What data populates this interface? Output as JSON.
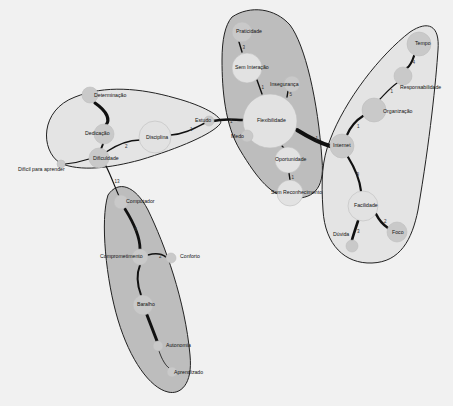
{
  "diagram": {
    "colors": {
      "background": "#f1f1f1",
      "cluster_light": "#e4e4e4",
      "cluster_dark": "#bdbdbd",
      "node": "#c9c9c9",
      "node_light": "#e2e2e2",
      "edge": "#111111"
    },
    "clusters": [
      {
        "id": "c1",
        "fill": "#e4e4e4",
        "path": "M60,163 C40,150 40,110 75,97 C105,85 140,88 175,98 C205,106 225,118 220,124 C212,134 180,148 140,160 C110,168 80,172 60,163 Z"
      },
      {
        "id": "c2",
        "fill": "#bdbdbd",
        "path": "M232,17 C250,5 275,8 290,25 C305,45 318,100 322,160 C325,190 312,200 290,198 C272,196 258,180 240,150 C225,125 222,90 222,60 C222,40 225,25 232,17 Z"
      },
      {
        "id": "c3",
        "fill": "#e4e4e4",
        "path": "M330,140 C345,100 380,55 410,32 C428,20 440,25 438,50 C436,80 430,140 418,210 C412,240 400,262 372,263 C345,264 325,245 323,210 C321,180 322,160 330,140 Z"
      },
      {
        "id": "c4",
        "fill": "#bdbdbd",
        "path": "M108,195 C118,180 135,185 148,210 C165,245 185,300 190,355 C193,385 180,395 168,392 C150,388 130,360 118,320 C106,280 100,220 108,195 Z"
      }
    ],
    "nodes": [
      {
        "id": "determinacao",
        "label": "Determinação",
        "x": 90,
        "y": 95,
        "r": 8,
        "lx": 94,
        "ly": 97
      },
      {
        "id": "dedicacao",
        "label": "Dedicação",
        "x": 104,
        "y": 134,
        "r": 10,
        "lx": 85,
        "ly": 135
      },
      {
        "id": "disciplina",
        "label": "Disciplina",
        "x": 155,
        "y": 137,
        "r": 16,
        "lx": 146,
        "ly": 139
      },
      {
        "id": "estudo",
        "label": "Estudo",
        "x": 209,
        "y": 121,
        "r": 5,
        "lx": 195,
        "ly": 122
      },
      {
        "id": "dificuldade",
        "label": "Dificuldade",
        "x": 99,
        "y": 158,
        "r": 10,
        "lx": 93,
        "ly": 160
      },
      {
        "id": "dificil",
        "label": "Difícil para aprender",
        "x": 61,
        "y": 164,
        "r": 4,
        "lx": 18,
        "ly": 171
      },
      {
        "id": "praticidade",
        "label": "Praticidade",
        "x": 242,
        "y": 32,
        "r": 10,
        "lx": 236,
        "ly": 33
      },
      {
        "id": "sem_interacao",
        "label": "Sem Interação",
        "x": 247,
        "y": 68,
        "r": 15,
        "lx": 235,
        "ly": 69
      },
      {
        "id": "inseguranca",
        "label": "Insegurança",
        "x": 292,
        "y": 84,
        "r": 8,
        "lx": 270,
        "ly": 86
      },
      {
        "id": "flexibilidade",
        "label": "Flexibilidade",
        "x": 270,
        "y": 121,
        "r": 27,
        "lx": 257,
        "ly": 122
      },
      {
        "id": "medo",
        "label": "Medo",
        "x": 247,
        "y": 136,
        "r": 6,
        "lx": 231,
        "ly": 138
      },
      {
        "id": "oportunidade",
        "label": "Oportunidade",
        "x": 288,
        "y": 160,
        "r": 13,
        "lx": 275,
        "ly": 161
      },
      {
        "id": "sem_reconhecimento",
        "label": "Sem Reconhecimento",
        "x": 290,
        "y": 193,
        "r": 13,
        "lx": 271,
        "ly": 194
      },
      {
        "id": "tempo",
        "label": "Tempo",
        "x": 419,
        "y": 44,
        "r": 12,
        "lx": 415,
        "ly": 45
      },
      {
        "id": "responsabilidade",
        "label": "Responsabilidade",
        "x": 403,
        "y": 76,
        "r": 9,
        "lx": 400,
        "ly": 89
      },
      {
        "id": "organizacao",
        "label": "Organização",
        "x": 374,
        "y": 110,
        "r": 12,
        "lx": 383,
        "ly": 113
      },
      {
        "id": "internet",
        "label": "Internet",
        "x": 342,
        "y": 146,
        "r": 12,
        "lx": 333,
        "ly": 147
      },
      {
        "id": "facilidade",
        "label": "Facilidade",
        "x": 363,
        "y": 206,
        "r": 15,
        "lx": 354,
        "ly": 207
      },
      {
        "id": "foco",
        "label": "Foco",
        "x": 397,
        "y": 232,
        "r": 10,
        "lx": 392,
        "ly": 234
      },
      {
        "id": "duvida",
        "label": "Dúvida",
        "x": 352,
        "y": 246,
        "r": 6,
        "lx": 333,
        "ly": 236
      },
      {
        "id": "computador",
        "label": "Computador",
        "x": 121,
        "y": 202,
        "r": 7,
        "lx": 126,
        "ly": 203
      },
      {
        "id": "comprometimento",
        "label": "Comprometimento",
        "x": 140,
        "y": 257,
        "r": 8,
        "lx": 100,
        "ly": 258
      },
      {
        "id": "conforto",
        "label": "Conforto",
        "x": 171,
        "y": 258,
        "r": 5,
        "lx": 180,
        "ly": 258
      },
      {
        "id": "baralho",
        "label": "Baralho",
        "x": 143,
        "y": 305,
        "r": 10,
        "lx": 137,
        "ly": 306
      },
      {
        "id": "autonomia",
        "label": "Autonomia",
        "x": 158,
        "y": 346,
        "r": 5,
        "lx": 166,
        "ly": 347
      },
      {
        "id": "aprendizado",
        "label": "Aprendizado",
        "x": 172,
        "y": 372,
        "r": 5,
        "lx": 174,
        "ly": 374
      }
    ],
    "edges": [
      {
        "from": "determinacao",
        "to": "dedicacao",
        "w": 3.2,
        "d": "M95,103 C108,112 110,120 106,125",
        "label": ""
      },
      {
        "from": "dedicacao",
        "to": "dificuldade",
        "w": 2,
        "d": "M103,144 L101,149",
        "label": ""
      },
      {
        "from": "dificuldade",
        "to": "disciplina",
        "w": 1.4,
        "d": "M106,152 C118,144 128,140 140,140",
        "label": "2"
      },
      {
        "from": "disciplina",
        "to": "estudo",
        "w": 1.6,
        "d": "M171,135 C185,134 195,128 205,123",
        "label": "1"
      },
      {
        "from": "estudo",
        "to": "flexibilidade",
        "w": 2.4,
        "d": "M213,121 C225,118 235,120 243,120",
        "label": "1"
      },
      {
        "from": "dificil",
        "to": "dificuldade",
        "w": 1.2,
        "d": "M65,164 C75,163 83,161 89,159",
        "label": ""
      },
      {
        "from": "dificuldade",
        "to": "computador",
        "w": 1.2,
        "d": "M106,166 C112,178 116,190 119,196",
        "label": "13"
      },
      {
        "from": "praticidade",
        "to": "sem_interacao",
        "w": 1.4,
        "d": "M239,42 L242,52",
        "label": "3"
      },
      {
        "from": "sem_interacao",
        "to": "flexibilidade",
        "w": 1.4,
        "d": "M257,80 L262,94",
        "label": "1"
      },
      {
        "from": "inseguranca",
        "to": "flexibilidade",
        "w": 1.4,
        "d": "M288,91 L287,97",
        "label": "5"
      },
      {
        "from": "medo",
        "to": "flexibilidade",
        "w": 1.2,
        "d": "M250,133 L252,130",
        "label": "1"
      },
      {
        "from": "flexibilidade",
        "to": "oportunidade",
        "w": 1.2,
        "d": "M282,146 L284,148",
        "label": ""
      },
      {
        "from": "oportunidade",
        "to": "sem_reconhecimento",
        "w": 1.4,
        "d": "M289,173 L290,180",
        "label": "1"
      },
      {
        "from": "flexibilidade",
        "to": "internet",
        "w": 4,
        "d": "M297,130 C310,138 320,143 330,146",
        "label": "1"
      },
      {
        "from": "tempo",
        "to": "responsabilidade",
        "w": 2.2,
        "d": "M414,56 C412,62 410,66 407,68",
        "label": "4"
      },
      {
        "from": "responsabilidade",
        "to": "organizacao",
        "w": 1.2,
        "d": "M397,83 C390,88 384,95 380,99",
        "label": "1"
      },
      {
        "from": "organizacao",
        "to": "internet",
        "w": 2.2,
        "d": "M363,116 C355,121 350,128 347,135",
        "label": "1"
      },
      {
        "from": "internet",
        "to": "facilidade",
        "w": 2.2,
        "d": "M348,157 C356,170 360,182 361,191",
        "label": "9"
      },
      {
        "from": "facilidade",
        "to": "foco",
        "w": 2.6,
        "d": "M376,214 C380,222 385,226 388,228",
        "label": "2"
      },
      {
        "from": "facilidade",
        "to": "duvida",
        "w": 2.6,
        "d": "M358,221 C355,230 353,236 352,240",
        "label": "3"
      },
      {
        "from": "computador",
        "to": "comprometimento",
        "w": 2.8,
        "d": "M125,209 C135,225 140,240 140,249",
        "label": "6"
      },
      {
        "from": "comprometimento",
        "to": "conforto",
        "w": 1.6,
        "d": "M148,255 C155,253 162,254 166,257",
        "label": "2"
      },
      {
        "from": "comprometimento",
        "to": "baralho",
        "w": 2,
        "d": "M140,265 C136,275 138,287 141,295",
        "label": ""
      },
      {
        "from": "baralho",
        "to": "autonomia",
        "w": 3,
        "d": "M147,315 C152,328 155,336 157,341",
        "label": ""
      },
      {
        "from": "autonomia",
        "to": "aprendizado",
        "w": 0.8,
        "d": "M159,351 C162,360 166,366 169,368",
        "label": ""
      }
    ]
  }
}
